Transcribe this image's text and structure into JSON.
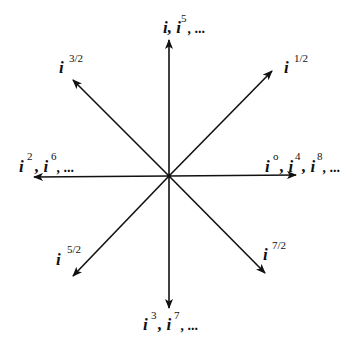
{
  "diagram": {
    "type": "powers-of-i-directions",
    "line_color": "#111111",
    "center": {
      "x": 169,
      "y": 176
    },
    "labels": {
      "up": {
        "base": "i, i",
        "sup": "5",
        "tail": ", ..."
      },
      "ne": {
        "base": "i",
        "sup": "1/2",
        "tail": ""
      },
      "nw": {
        "base": "i",
        "sup": "3/2",
        "tail": ""
      },
      "left": {
        "parts": [
          {
            "base": "i",
            "sup": "2"
          },
          {
            "base": ", i",
            "sup": "6"
          }
        ],
        "tail": ", ..."
      },
      "right": {
        "parts": [
          {
            "base": "i",
            "sup": "o"
          },
          {
            "base": ", i",
            "sup": "4"
          },
          {
            "base": ", i",
            "sup": "8"
          }
        ],
        "tail": ", ..."
      },
      "sw": {
        "base": "i",
        "sup": "5/2",
        "tail": ""
      },
      "se": {
        "base": "i",
        "sup": "7/2",
        "tail": ""
      },
      "down": {
        "parts": [
          {
            "base": "i",
            "sup": "3"
          },
          {
            "base": ", i",
            "sup": "7"
          }
        ],
        "tail": ", ..."
      }
    }
  }
}
